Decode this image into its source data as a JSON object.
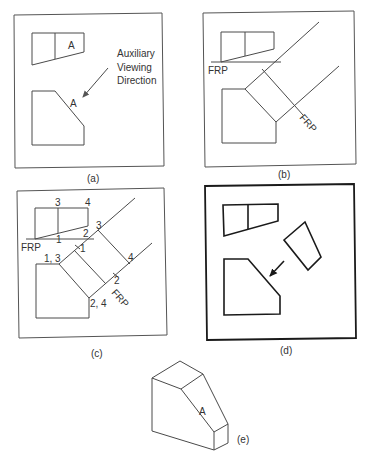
{
  "figure": {
    "panels": [
      {
        "id": "a",
        "caption": "(a)",
        "surface_label_top": "A",
        "surface_label_front": "A",
        "annotation": [
          "Auxiliary",
          "Viewing",
          "Direction"
        ]
      },
      {
        "id": "b",
        "caption": "(b)",
        "frp_label_top": "FRP",
        "frp_label_aux": "FRP"
      },
      {
        "id": "c",
        "caption": "(c)",
        "frp_label_top": "FRP",
        "frp_label_aux": "FRP",
        "point_labels": {
          "top_3": "3",
          "top_4": "4",
          "top_1": "1",
          "top_2": "2",
          "front_13": "1, 3",
          "front_24": "2, 4",
          "aux_3": "3",
          "aux_1": "1",
          "aux_4": "4",
          "aux_2": "2"
        }
      },
      {
        "id": "d",
        "caption": "(d)"
      },
      {
        "id": "e",
        "caption": "(e)",
        "surface_label": "A"
      }
    ]
  }
}
